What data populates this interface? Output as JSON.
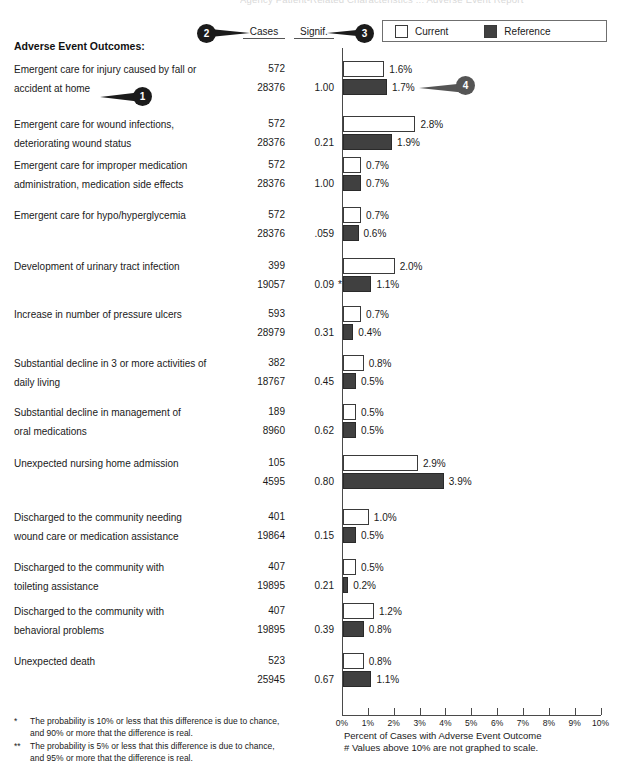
{
  "cut_title": "Agency Patient-Related Characteristics ... Adverse Event Report",
  "section_title": "Adverse Event Outcomes:",
  "columns": {
    "cases": "Cases",
    "signif": "Signif."
  },
  "legend": {
    "current_label": "Current",
    "current_color": "#ffffff",
    "reference_label": "Reference",
    "reference_color": "#404040"
  },
  "callouts": [
    {
      "id": "1",
      "number": "1"
    },
    {
      "id": "2",
      "number": "2"
    },
    {
      "id": "3",
      "number": "3"
    },
    {
      "id": "4",
      "number": "4"
    }
  ],
  "axis": {
    "caption_line1": "Percent of Cases with Adverse Event Outcome",
    "caption_line2": "# Values above 10% are not graphed to scale.",
    "ticks": [
      "0%",
      "1%",
      "2%",
      "3%",
      "4%",
      "5%",
      "6%",
      "7%",
      "8%",
      "9%",
      "10%"
    ]
  },
  "footnotes": [
    {
      "mark": "*",
      "line1": "The probability is 10% or less that this difference is due to chance,",
      "line2": "and 90% or more that the difference is real."
    },
    {
      "mark": "**",
      "line1": "The probability is 5% or less that this difference is due to chance,",
      "line2": "and 95% or more that the difference is real."
    }
  ],
  "chart_data": {
    "type": "bar",
    "title": "Adverse Event Outcomes",
    "xlabel": "Percent of Cases with Adverse Event Outcome",
    "ylabel": "",
    "xlim": [
      0,
      10
    ],
    "xunit": "%",
    "grid": false,
    "legend_position": "top-right",
    "series": [
      {
        "name": "Current",
        "color": "#ffffff"
      },
      {
        "name": "Reference",
        "color": "#404040"
      }
    ],
    "categories": [
      "Emergent care for injury caused by fall or accident at home",
      "Emergent care for wound infections, deteriorating wound status",
      "Emergent care for improper medication administration, medication side effects",
      "Emergent care for hypo/hyperglycemia",
      "Development of urinary tract infection",
      "Increase in number of pressure ulcers",
      "Substantial decline in 3 or more activities of daily living",
      "Substantial decline in management of oral medications",
      "Unexpected nursing home admission",
      "Discharged to the community needing wound care or medication assistance",
      "Discharged to the community with toileting assistance",
      "Discharged to the community with behavioral problems",
      "Unexpected death"
    ],
    "rows": [
      {
        "label_line1": "Emergent care for injury caused by fall or",
        "label_line2": "accident at home",
        "cases_current": "572",
        "cases_reference": "28376",
        "signif": "1.00",
        "star": "",
        "current_pct": 1.6,
        "current_label": "1.6%",
        "reference_pct": 1.7,
        "reference_label": "1.7%"
      },
      {
        "label_line1": "Emergent care for wound infections,",
        "label_line2": "deteriorating wound status",
        "cases_current": "572",
        "cases_reference": "28376",
        "signif": "0.21",
        "star": "",
        "current_pct": 2.8,
        "current_label": "2.8%",
        "reference_pct": 1.9,
        "reference_label": "1.9%"
      },
      {
        "label_line1": "Emergent care for improper medication",
        "label_line2": "administration, medication side effects",
        "cases_current": "572",
        "cases_reference": "28376",
        "signif": "1.00",
        "star": "",
        "current_pct": 0.7,
        "current_label": "0.7%",
        "reference_pct": 0.7,
        "reference_label": "0.7%"
      },
      {
        "label_line1": "Emergent care for hypo/hyperglycemia",
        "label_line2": "",
        "cases_current": "572",
        "cases_reference": "28376",
        "signif": ".059",
        "star": "",
        "current_pct": 0.7,
        "current_label": "0.7%",
        "reference_pct": 0.6,
        "reference_label": "0.6%"
      },
      {
        "label_line1": "Development of urinary tract infection",
        "label_line2": "",
        "cases_current": "399",
        "cases_reference": "19057",
        "signif": "0.09",
        "star": "*",
        "current_pct": 2.0,
        "current_label": "2.0%",
        "reference_pct": 1.1,
        "reference_label": "1.1%"
      },
      {
        "label_line1": "Increase in number of pressure ulcers",
        "label_line2": "",
        "cases_current": "593",
        "cases_reference": "28979",
        "signif": "0.31",
        "star": "",
        "current_pct": 0.7,
        "current_label": "0.7%",
        "reference_pct": 0.4,
        "reference_label": "0.4%"
      },
      {
        "label_line1": "Substantial decline in 3 or more activities of",
        "label_line2": "daily living",
        "cases_current": "382",
        "cases_reference": "18767",
        "signif": "0.45",
        "star": "",
        "current_pct": 0.8,
        "current_label": "0.8%",
        "reference_pct": 0.5,
        "reference_label": "0.5%"
      },
      {
        "label_line1": "Substantial decline in management of",
        "label_line2": "oral medications",
        "cases_current": "189",
        "cases_reference": "8960",
        "signif": "0.62",
        "star": "",
        "current_pct": 0.5,
        "current_label": "0.5%",
        "reference_pct": 0.5,
        "reference_label": "0.5%"
      },
      {
        "label_line1": "Unexpected nursing home admission",
        "label_line2": "",
        "cases_current": "105",
        "cases_reference": "4595",
        "signif": "0.80",
        "star": "",
        "current_pct": 2.9,
        "current_label": "2.9%",
        "reference_pct": 3.9,
        "reference_label": "3.9%"
      },
      {
        "label_line1": "Discharged to the community needing",
        "label_line2": "wound care or medication assistance",
        "cases_current": "401",
        "cases_reference": "19864",
        "signif": "0.15",
        "star": "",
        "current_pct": 1.0,
        "current_label": "1.0%",
        "reference_pct": 0.5,
        "reference_label": "0.5%"
      },
      {
        "label_line1": "Discharged to the community with",
        "label_line2": "toileting assistance",
        "cases_current": "407",
        "cases_reference": "19895",
        "signif": "0.21",
        "star": "",
        "current_pct": 0.5,
        "current_label": "0.5%",
        "reference_pct": 0.2,
        "reference_label": "0.2%"
      },
      {
        "label_line1": "Discharged to the community with",
        "label_line2": "behavioral problems",
        "cases_current": "407",
        "cases_reference": "19895",
        "signif": "0.39",
        "star": "",
        "current_pct": 1.2,
        "current_label": "1.2%",
        "reference_pct": 0.8,
        "reference_label": "0.8%"
      },
      {
        "label_line1": "Unexpected death",
        "label_line2": "",
        "cases_current": "523",
        "cases_reference": "25945",
        "signif": "0.67",
        "star": "",
        "current_pct": 0.8,
        "current_label": "0.8%",
        "reference_pct": 1.1,
        "reference_label": "1.1%"
      }
    ]
  }
}
